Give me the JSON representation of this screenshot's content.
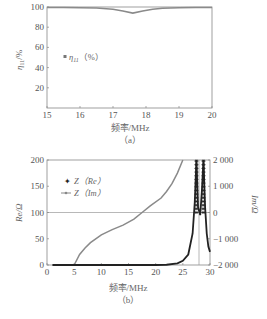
{
  "chart_data": [
    {
      "id": "a",
      "type": "line",
      "caption": "（a）",
      "xlabel": "频率/MHz",
      "ylabel": "η11/%",
      "xlim": [
        15,
        20
      ],
      "ylim": [
        0,
        100
      ],
      "xticks": [
        "15",
        "16",
        "17",
        "18",
        "19",
        "20"
      ],
      "yticks": [
        "20",
        "40",
        "60",
        "80",
        "100"
      ],
      "grid": false,
      "legend_position": "middle-left",
      "series": [
        {
          "name": "η11（%）",
          "color": "#888888",
          "x": [
            15,
            15.5,
            16,
            16.5,
            17,
            17.3,
            17.6,
            17.9,
            18.2,
            18.5,
            19,
            19.5,
            20
          ],
          "y": [
            99.5,
            99.5,
            99.3,
            99,
            97.8,
            96,
            94,
            96,
            97.8,
            98.8,
            99.3,
            99.5,
            99.5
          ]
        }
      ]
    },
    {
      "id": "b",
      "type": "line",
      "caption": "（b）",
      "xlabel": "频率/MHz",
      "ylabel": "Re/Ω",
      "ylabel_right": "Im/Ω",
      "xlim": [
        0,
        30
      ],
      "ylim": [
        0,
        200
      ],
      "ylim_right": [
        -2000,
        2000
      ],
      "xticks": [
        "0",
        "5",
        "10",
        "15",
        "20",
        "25",
        "30"
      ],
      "yticks": [
        "0",
        "50",
        "100",
        "150",
        "200"
      ],
      "yticks_right": [
        "-2 000",
        "-1 000",
        "0",
        "1 000",
        "2 000"
      ],
      "reference_lines": {
        "horizontal_left_value": 100,
        "vertical_x": 28
      },
      "grid": false,
      "legend_position": "upper-left",
      "series": [
        {
          "name": "Z（Re）",
          "axis": "left",
          "color": "#222222",
          "marker": "plus",
          "x": [
            1,
            5,
            10,
            15,
            20,
            22,
            24,
            25,
            26,
            26.8,
            27.2,
            27.5,
            27.8,
            28.2,
            28.5,
            28.8,
            29.1,
            29.4,
            29.7,
            30
          ],
          "y": [
            0,
            0,
            0,
            0,
            0,
            0.5,
            3,
            8,
            20,
            60,
            120,
            200,
            110,
            95,
            140,
            200,
            110,
            60,
            35,
            25
          ]
        },
        {
          "name": "Z（Im）",
          "axis": "right",
          "color": "#888888",
          "marker": "dot",
          "x": [
            5,
            6,
            7,
            8,
            10,
            12,
            14,
            16,
            17.5,
            19,
            21,
            22,
            23,
            24,
            25
          ],
          "y": [
            -2000,
            -1600,
            -1350,
            -1150,
            -850,
            -650,
            -480,
            -250,
            0,
            250,
            550,
            800,
            1100,
            1500,
            2000
          ]
        }
      ]
    }
  ],
  "labels": {
    "a_xlabel": "频率/MHz",
    "a_caption": "（a）",
    "a_ylabel_main": "η",
    "a_ylabel_sub": "11",
    "a_ylabel_unit": "/%",
    "a_legend_main": "η",
    "a_legend_sub": "11",
    "a_legend_unit": "（%）",
    "b_xlabel": "频率/MHz",
    "b_caption": "（b）",
    "b_ylabel_left": "Re/Ω",
    "b_ylabel_right": "Im/Ω",
    "b_legend_re": "Z（Re）",
    "b_legend_im": "Z（Im）"
  }
}
